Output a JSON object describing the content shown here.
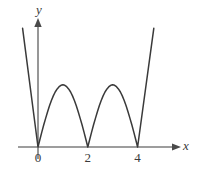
{
  "chart_data": {
    "type": "line",
    "title": "",
    "xlabel": "x",
    "ylabel": "y",
    "xlim": [
      -0.7,
      6.2
    ],
    "ylim": [
      -0.35,
      4.6
    ],
    "grid": false,
    "legend": null,
    "axis_arrows": {
      "x": "right",
      "y": "up"
    },
    "xticks": [
      0,
      2,
      4
    ],
    "xtick_labels": [
      "0",
      "2",
      "4"
    ],
    "yticks": [],
    "ytick_labels": [],
    "series": [
      {
        "name": "curve",
        "color": "#3a3a3a",
        "zeros": [
          0,
          2,
          4
        ],
        "peaks": [
          {
            "x": 1.05,
            "y": 2.75
          },
          {
            "x": 3.05,
            "y": 2.75
          }
        ],
        "endpoints": [
          {
            "x": -0.62,
            "y": 5.25
          },
          {
            "x": 4.65,
            "y": 5.25
          }
        ],
        "points": [
          {
            "x": -0.62,
            "y": 5.25
          },
          {
            "x": 0.0,
            "y": 0.0
          },
          {
            "x": 0.35,
            "y": 1.75
          },
          {
            "x": 0.7,
            "y": 2.55
          },
          {
            "x": 1.05,
            "y": 2.75
          },
          {
            "x": 1.4,
            "y": 2.45
          },
          {
            "x": 1.75,
            "y": 1.35
          },
          {
            "x": 2.0,
            "y": 0.0
          },
          {
            "x": 2.3,
            "y": 1.55
          },
          {
            "x": 2.65,
            "y": 2.45
          },
          {
            "x": 3.05,
            "y": 2.75
          },
          {
            "x": 3.4,
            "y": 2.5
          },
          {
            "x": 3.75,
            "y": 1.4
          },
          {
            "x": 4.0,
            "y": 0.0
          },
          {
            "x": 4.65,
            "y": 5.25
          }
        ]
      }
    ]
  },
  "labels": {
    "y_axis": "y",
    "x_axis": "x",
    "tick_0": "0",
    "tick_2": "2",
    "tick_4": "4"
  },
  "colors": {
    "curve": "#3a3a3a",
    "axis": "#7d7d7d",
    "background": "#ffffff",
    "text": "#3a3a3a"
  }
}
